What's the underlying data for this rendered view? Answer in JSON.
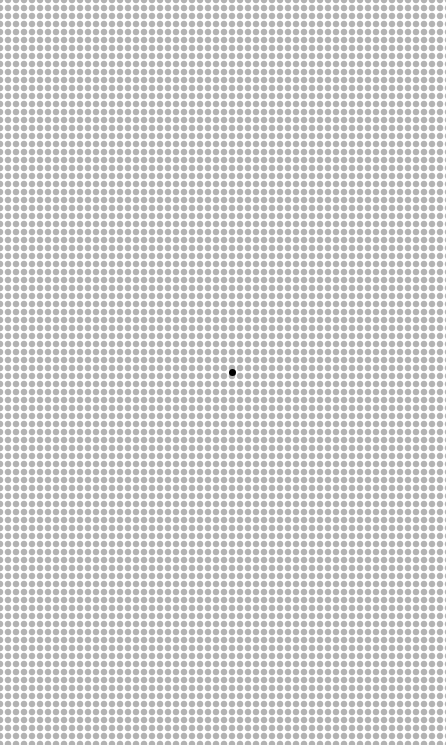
{
  "canvas": {
    "width": 446,
    "height": 745,
    "background_color": "#ffffff"
  },
  "dot_grid": {
    "pitch_x": 8,
    "pitch_y": 8,
    "origin_x": 0,
    "origin_y": 0,
    "dot_diameter": 5.6,
    "dot_color": "#b3b3b3",
    "columns": 57,
    "rows": 94
  },
  "target_dot": {
    "center_x": 232,
    "center_y": 372,
    "diameter": 7,
    "color": "#000000",
    "grid_column": 29,
    "grid_row": 46
  }
}
